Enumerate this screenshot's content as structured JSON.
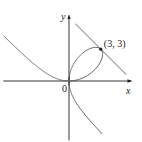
{
  "figure": {
    "curve_equation": "x^3 + y^3 = 6xy",
    "tangent_line": "x + y = 6",
    "labels": {
      "x_axis": "x",
      "y_axis": "y",
      "origin": "0",
      "point": "(3, 3)"
    },
    "point": {
      "x": 3,
      "y": 3
    },
    "x_range": [
      -6.2,
      5.9
    ],
    "y_range": [
      -5.6,
      6.2
    ],
    "tangent_x_range": [
      0.6,
      5.4
    ],
    "colors": {
      "ink": "#231f20",
      "curve": "#555555"
    }
  }
}
